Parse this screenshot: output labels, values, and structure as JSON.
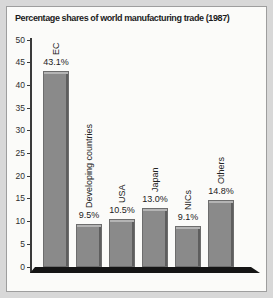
{
  "window": {
    "background": "#d8d8d8",
    "panel_background": "#fbfbf9",
    "panel_border": "#9e9e9e"
  },
  "chart_data": {
    "type": "bar",
    "title": "Percentage shares of world manufacturing trade (1987)",
    "categories": [
      "EC",
      "Developing countries",
      "USA",
      "Japan",
      "NICs",
      "Others"
    ],
    "values": [
      43.1,
      9.5,
      10.5,
      13.0,
      9.1,
      14.8
    ],
    "value_labels": [
      "43.1%",
      "9.5%",
      "10.5%",
      "13.0%",
      "9.1%",
      "14.8%"
    ],
    "xlabel": "",
    "ylabel": "",
    "ylim": [
      0,
      50
    ],
    "yticks": [
      0,
      5,
      10,
      15,
      20,
      25,
      30,
      35,
      40,
      45,
      50
    ],
    "grid": false,
    "legend": "none",
    "bar_color": "#8a8a8a",
    "bar_highlight": "#b4b4b4",
    "bar_shadow": "#5e5e5e",
    "axis_color": "#3a3a3a",
    "floor_color": "#151515"
  }
}
